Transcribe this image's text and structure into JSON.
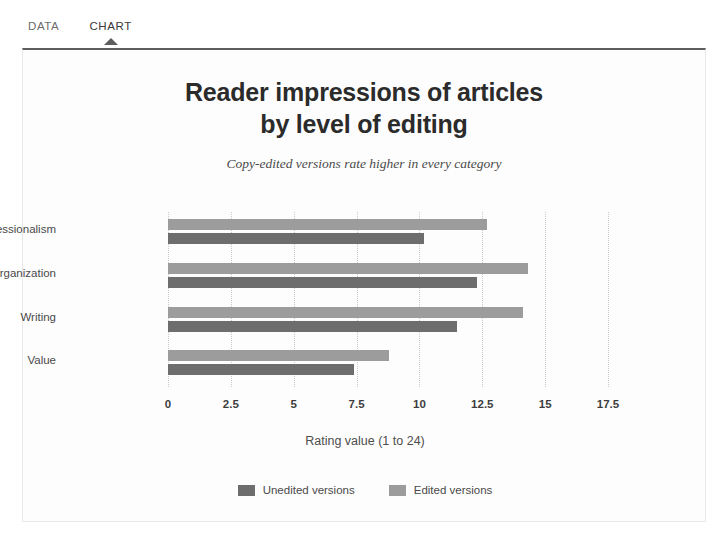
{
  "tabs": [
    {
      "label": "DATA",
      "active": false
    },
    {
      "label": "CHART",
      "active": true
    }
  ],
  "chart_data": {
    "type": "bar",
    "orientation": "horizontal",
    "title": "Reader impressions of articles by level of editing",
    "title_line1": "Reader impressions of articles",
    "title_line2": "by level of editing",
    "subtitle": "Copy-edited versions rate higher in every category",
    "xlabel": "Rating value (1 to 24)",
    "ylabel": "",
    "categories": [
      "Professionalism",
      "Organization",
      "Writing",
      "Value"
    ],
    "series": [
      {
        "name": "Unedited versions",
        "color": "#6d6d6d",
        "values": [
          10.2,
          12.3,
          11.5,
          7.4
        ]
      },
      {
        "name": "Edited versions",
        "color": "#9c9c9c",
        "values": [
          12.7,
          14.3,
          14.1,
          8.8
        ]
      }
    ],
    "xlim": [
      0,
      17.5
    ],
    "xticks": [
      "0",
      "2.5",
      "5",
      "7.5",
      "10",
      "12.5",
      "15",
      "17.5"
    ],
    "xtick_values": [
      0,
      2.5,
      5,
      7.5,
      10,
      12.5,
      15,
      17.5
    ],
    "grid": "vertical-dotted",
    "legend_position": "bottom"
  },
  "colors": {
    "panel_border": "#e8e8e8",
    "panel_top_rule": "#5d5d5d",
    "gridline": "#c9c9c9",
    "text": "#3d3d3d"
  }
}
